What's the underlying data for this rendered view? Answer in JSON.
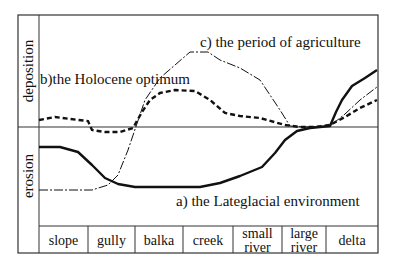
{
  "axis": {
    "upper_label": "deposition",
    "lower_label": "erosion"
  },
  "curves": {
    "a": {
      "label": "a) the Lateglacial environment",
      "style": "thick solid"
    },
    "b": {
      "label": "b)the Holocene optimum",
      "style": "dashed"
    },
    "c": {
      "label": "c) the period of agriculture",
      "style": "thin dash-dot"
    }
  },
  "categories": [
    {
      "lines": [
        "slope"
      ]
    },
    {
      "lines": [
        "gully"
      ]
    },
    {
      "lines": [
        "balka"
      ]
    },
    {
      "lines": [
        "creek"
      ]
    },
    {
      "lines": [
        "small",
        "river"
      ]
    },
    {
      "lines": [
        "large",
        "river"
      ]
    },
    {
      "lines": [
        "delta"
      ]
    }
  ],
  "colors": {
    "ink": "#111111",
    "frame": "#333333",
    "background": "#ffffff"
  }
}
